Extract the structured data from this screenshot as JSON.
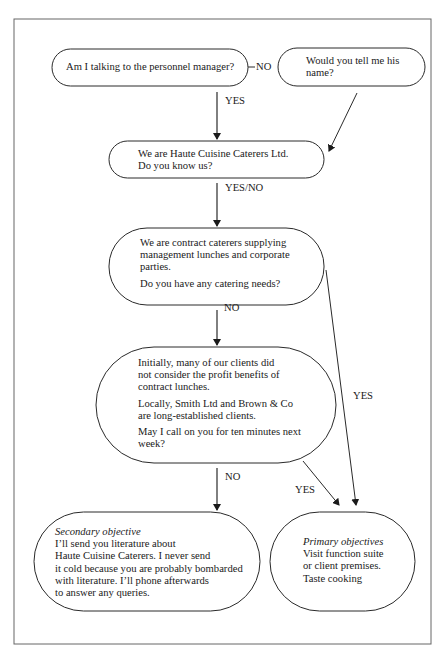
{
  "nodes": {
    "personnel_question": {
      "text": "Am I talking to the personnel manager?"
    },
    "ask_name": {
      "lines": [
        "Would you tell me his",
        "name?"
      ]
    },
    "introduction": {
      "lines": [
        "We are Haute Cuisine Caterers Ltd.",
        "Do you know us?"
      ]
    },
    "service_pitch": {
      "para1": [
        "We are contract caterers supplying",
        "management lunches and corporate",
        "parties."
      ],
      "para2": [
        "Do you have any catering needs?"
      ]
    },
    "objection_handling": {
      "para1": [
        "Initially, many of our clients did",
        "not consider the profit benefits of",
        "contract lunches."
      ],
      "para2": [
        "Locally, Smith Ltd and Brown & Co",
        "are long-established clients."
      ],
      "para3": [
        "May I call on you for ten minutes next",
        "week?"
      ]
    },
    "secondary_objective": {
      "title": "Secondary objective",
      "lines": [
        "I’ll send you literature about",
        "Haute Cuisine Caterers. I never send",
        "it cold because you are probably bombarded",
        "with literature. I’ll phone afterwards",
        "to answer any queries."
      ]
    },
    "primary_objectives": {
      "title": "Primary objectives",
      "lines": [
        "Visit function suite",
        "or client premises.",
        "Taste cooking"
      ]
    }
  },
  "edges": {
    "personnel_no": "NO",
    "personnel_yes": "YES",
    "intro_yes_no": "YES/NO",
    "pitch_no": "NO",
    "pitch_yes": "YES",
    "objection_no": "NO",
    "objection_yes": "YES"
  },
  "colors": {
    "stroke": "#2a2a2a",
    "background": "#ffffff",
    "frame": "#555555"
  }
}
